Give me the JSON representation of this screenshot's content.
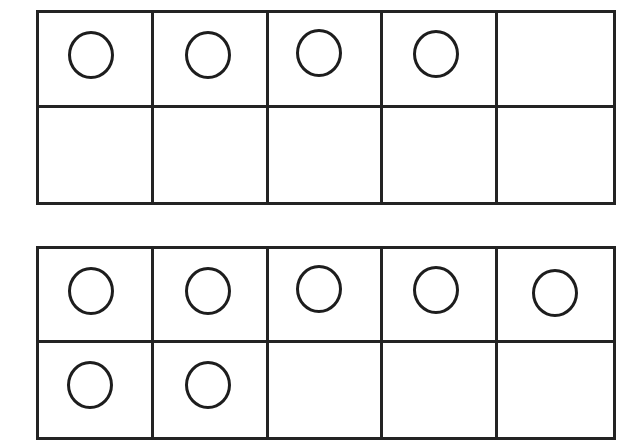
{
  "page": {
    "background_color": "#ffffff",
    "line_color": "#232323",
    "counter_color": "#1d1d1d"
  },
  "diagram": {
    "type": "ten-frame",
    "frames_count": 2,
    "columns": 5,
    "rows": 2,
    "cells_per_frame": 10,
    "counter_shape": "circle",
    "fill_order": "left-to-right, top-row-first",
    "frames": [
      {
        "name": "ten-frame-1",
        "filled_count": 4,
        "empty_count": 6,
        "cells": [
          {
            "pos": "r1c1",
            "row": 1,
            "col": 1,
            "filled": true
          },
          {
            "pos": "r1c2",
            "row": 1,
            "col": 2,
            "filled": true
          },
          {
            "pos": "r1c3",
            "row": 1,
            "col": 3,
            "filled": true
          },
          {
            "pos": "r1c4",
            "row": 1,
            "col": 4,
            "filled": true
          },
          {
            "pos": "r1c5",
            "row": 1,
            "col": 5,
            "filled": false
          },
          {
            "pos": "r2c1",
            "row": 2,
            "col": 1,
            "filled": false
          },
          {
            "pos": "r2c2",
            "row": 2,
            "col": 2,
            "filled": false
          },
          {
            "pos": "r2c3",
            "row": 2,
            "col": 3,
            "filled": false
          },
          {
            "pos": "r2c4",
            "row": 2,
            "col": 4,
            "filled": false
          },
          {
            "pos": "r2c5",
            "row": 2,
            "col": 5,
            "filled": false
          }
        ]
      },
      {
        "name": "ten-frame-2",
        "filled_count": 7,
        "empty_count": 3,
        "cells": [
          {
            "pos": "r1c1",
            "row": 1,
            "col": 1,
            "filled": true
          },
          {
            "pos": "r1c2",
            "row": 1,
            "col": 2,
            "filled": true
          },
          {
            "pos": "r1c3",
            "row": 1,
            "col": 3,
            "filled": true
          },
          {
            "pos": "r1c4",
            "row": 1,
            "col": 4,
            "filled": true
          },
          {
            "pos": "r1c5",
            "row": 1,
            "col": 5,
            "filled": true
          },
          {
            "pos": "r2c1",
            "row": 2,
            "col": 1,
            "filled": true
          },
          {
            "pos": "r2c2",
            "row": 2,
            "col": 2,
            "filled": true
          },
          {
            "pos": "r2c3",
            "row": 2,
            "col": 3,
            "filled": false
          },
          {
            "pos": "r2c4",
            "row": 2,
            "col": 4,
            "filled": false
          },
          {
            "pos": "r2c5",
            "row": 2,
            "col": 5,
            "filled": false
          }
        ]
      }
    ]
  },
  "chart_data": {
    "type": "table",
    "categories": [
      "Ten-Frame 1",
      "Ten-Frame 2"
    ],
    "values": [
      4,
      7
    ],
    "ylabel": "Counters shown",
    "ylim": [
      0,
      10
    ]
  }
}
